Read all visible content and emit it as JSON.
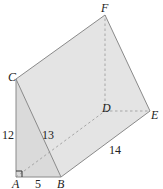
{
  "diagram": {
    "type": "triangular-prism",
    "vertices": {
      "A": {
        "label": "A",
        "x": 16,
        "y": 177
      },
      "B": {
        "label": "B",
        "x": 61,
        "y": 177
      },
      "C": {
        "label": "C",
        "x": 16,
        "y": 79
      },
      "D": {
        "label": "D",
        "x": 105,
        "y": 111
      },
      "E": {
        "label": "E",
        "x": 150,
        "y": 111
      },
      "F": {
        "label": "F",
        "x": 105,
        "y": 15
      }
    },
    "measurements": {
      "AC": "12",
      "AB": "5",
      "BC": "13",
      "BE": "14"
    },
    "right_angle_at": "A",
    "colors": {
      "face_fill": "#e6e6e6",
      "front_face_fill": "#dcdcdc",
      "edge": "#8a8a8a",
      "hidden_edge": "#a0a0a0"
    }
  }
}
